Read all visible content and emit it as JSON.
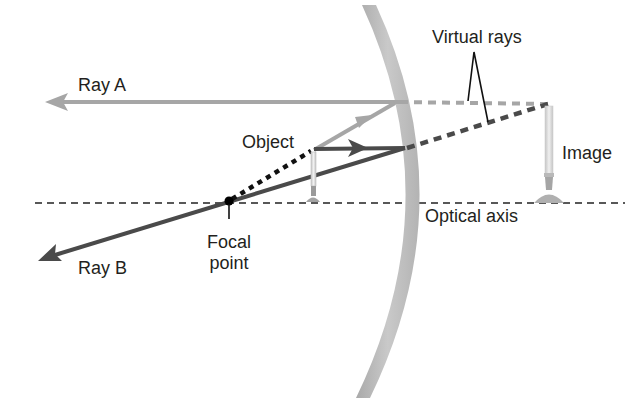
{
  "diagram": {
    "type": "convex-mirror-ray-diagram",
    "labels": {
      "ray_a": "Ray A",
      "ray_b": "Ray B",
      "virtual_rays": "Virtual rays",
      "object": "Object",
      "image": "Image",
      "optical_axis": "Optical axis",
      "focal_point_line1": "Focal",
      "focal_point_line2": "point"
    },
    "colors": {
      "mirror": "#b8b8b8",
      "ray_a": "#a6a6a6",
      "ray_b": "#4a4a4a",
      "incident_ray_to_focus": "#111111",
      "axis": "#222222",
      "virtual_ray_a": "#a6a6a6",
      "virtual_ray_b": "#4a4a4a",
      "candle": "#d9d9d9",
      "text": "#231f20"
    },
    "elements": {
      "mirror": "convex mirror arc",
      "focal_point": "black dot on optical axis in front of mirror",
      "object": "small candle upright on axis",
      "image": "taller virtual candle behind mirror"
    }
  }
}
